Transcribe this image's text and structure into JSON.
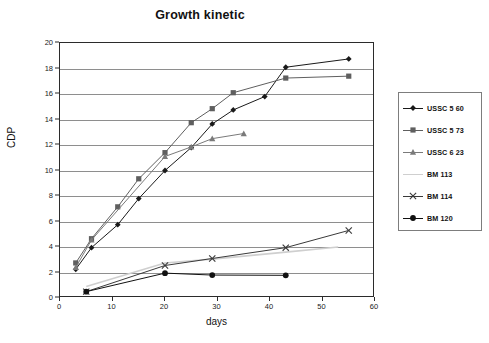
{
  "chart_data": {
    "type": "line",
    "title": "Growth kinetic",
    "xlabel": "days",
    "ylabel": "CDP",
    "xlim": [
      0,
      60
    ],
    "ylim": [
      0,
      20
    ],
    "xticks": [
      0,
      10,
      20,
      30,
      40,
      50,
      60
    ],
    "yticks": [
      0,
      2,
      4,
      6,
      8,
      10,
      12,
      14,
      16,
      18,
      20
    ],
    "grid": "horizontal",
    "legend_position": "right",
    "series": [
      {
        "name": "USSC 5 60",
        "marker": "diamond",
        "color": "#1a1a1a",
        "x": [
          3,
          6,
          11,
          15,
          20,
          25,
          29,
          33,
          39,
          43,
          55
        ],
        "y": [
          2.25,
          3.95,
          5.75,
          7.8,
          10.0,
          11.8,
          13.65,
          14.75,
          15.8,
          18.1,
          18.75
        ]
      },
      {
        "name": "USSC 5 73",
        "marker": "square",
        "color": "#5f5f5f",
        "x": [
          3,
          6,
          11,
          15,
          20,
          25,
          29,
          33,
          43,
          55
        ],
        "y": [
          2.75,
          4.65,
          7.15,
          9.35,
          11.4,
          13.75,
          14.85,
          16.1,
          17.25,
          17.4
        ]
      },
      {
        "name": "USSC 6 23",
        "marker": "triangle",
        "color": "#7a7a7a",
        "x": [
          3,
          6,
          20,
          25,
          29,
          35
        ],
        "y": [
          2.4,
          4.55,
          11.1,
          11.85,
          12.5,
          12.9
        ]
      },
      {
        "name": "BM 113",
        "marker": "none",
        "color": "#cfcfcf",
        "x": [
          5,
          20,
          29,
          43,
          53
        ],
        "y": [
          0.9,
          2.75,
          3.05,
          3.6,
          4.0
        ]
      },
      {
        "name": "BM 114",
        "marker": "cross",
        "color": "#3a3a3a",
        "x": [
          5,
          20,
          29,
          43,
          55
        ],
        "y": [
          0.5,
          2.55,
          3.1,
          3.95,
          5.3
        ]
      },
      {
        "name": "BM 120",
        "marker": "circle",
        "color": "#111111",
        "x": [
          5,
          20,
          29,
          43
        ],
        "y": [
          0.5,
          1.95,
          1.8,
          1.78
        ]
      }
    ]
  },
  "legend": {
    "items": [
      {
        "label": "USSC 5 60"
      },
      {
        "label": "USSC 5 73"
      },
      {
        "label": "USSC 6 23"
      },
      {
        "label": "BM 113"
      },
      {
        "label": "BM 114"
      },
      {
        "label": "BM 120"
      }
    ]
  }
}
